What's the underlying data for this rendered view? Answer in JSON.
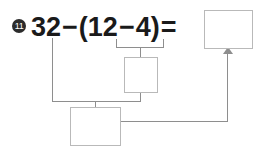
{
  "problem": {
    "number_label": "11",
    "number_glyph": "11"
  },
  "equation": {
    "full_text": "32-(12-4)=",
    "tokens": [
      {
        "text": "32",
        "kind": "number"
      },
      {
        "text": "−",
        "kind": "operator"
      },
      {
        "text": "(",
        "kind": "paren"
      },
      {
        "text": "12",
        "kind": "number"
      },
      {
        "text": "−",
        "kind": "operator"
      },
      {
        "text": "4",
        "kind": "number"
      },
      {
        "text": ")",
        "kind": "paren"
      },
      {
        "text": "=",
        "kind": "equals"
      }
    ],
    "minuend": "32",
    "paren_left_operand": "12",
    "paren_right_operand": "4",
    "operator": "−",
    "equals_sign": "="
  },
  "answer_boxes": {
    "result": {
      "value": "",
      "placeholder": ""
    },
    "paren_result": {
      "value": "",
      "placeholder": ""
    },
    "subtraction_result": {
      "value": "",
      "placeholder": ""
    }
  },
  "style": {
    "line_color": "#8e8e8e",
    "box_border_color": "#b9b9b9",
    "text_color": "#1a1a1a",
    "background_color": "#ffffff",
    "marker_fill": "#2b2b2b"
  }
}
